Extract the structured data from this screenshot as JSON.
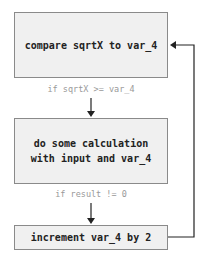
{
  "nodes": [
    {
      "id": "compare",
      "label": "compare sqrtX to var_4"
    },
    {
      "id": "calc",
      "label": "do some calculation with input and var_4"
    },
    {
      "id": "increment",
      "label": "increment var_4 by 2"
    }
  ],
  "edges": [
    {
      "from": "compare",
      "to": "calc",
      "label": "if sqrtX >= var_4"
    },
    {
      "from": "calc",
      "to": "increment",
      "label": "if result != 0"
    },
    {
      "from": "increment",
      "to": "compare",
      "label": ""
    }
  ]
}
